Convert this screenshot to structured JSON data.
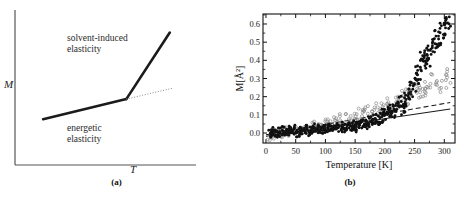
{
  "figure": {
    "panels": [
      {
        "id": "a",
        "caption": "(a)",
        "xlabel": "T",
        "ylabel": "M",
        "annotations": [
          {
            "key": "upper",
            "text": "solvent-induced\nelasticity"
          },
          {
            "key": "lower",
            "text": "energetic\nelasticity"
          }
        ],
        "chart_data": {
          "type": "line",
          "title": "",
          "xlabel": "T",
          "ylabel": "M",
          "xlim": [
            0,
            1
          ],
          "ylim": [
            0,
            1
          ],
          "grid": false,
          "legend": "none",
          "axes_style": "open-L (left and bottom spines only), no tick marks, no numeric ticks",
          "series": [
            {
              "name": "energetic elasticity regime",
              "style": "thick solid",
              "points": [
                [
                  0.155,
                  0.295
                ],
                [
                  0.615,
                  0.425
                ]
              ]
            },
            {
              "name": "solvent-induced elasticity regime",
              "style": "thick solid",
              "points": [
                [
                  0.615,
                  0.425
                ],
                [
                  0.855,
                  0.855
                ]
              ]
            },
            {
              "name": "extrapolation of energetic slope",
              "style": "fine dotted",
              "points": [
                [
                  0.615,
                  0.425
                ],
                [
                  0.875,
                  0.497
                ]
              ]
            }
          ]
        }
      },
      {
        "id": "b",
        "caption": "(b)",
        "chart_data": {
          "type": "scatter",
          "title": "",
          "xlabel": "Temperature [K]",
          "ylabel": "M[Å²]",
          "xlim": [
            -5,
            318
          ],
          "ylim": [
            -0.055,
            0.655
          ],
          "xticks": [
            0,
            50,
            100,
            150,
            200,
            250,
            300
          ],
          "yticks": [
            0.0,
            0.1,
            0.2,
            0.3,
            0.4,
            0.5,
            0.6
          ],
          "ytick_labels": [
            "0.0",
            "0.1",
            "0.2",
            "0.3",
            "0.4",
            "0.5",
            "0.6"
          ],
          "xtick_labels": [
            "0",
            "50",
            "100",
            "150",
            "200",
            "250",
            "300"
          ],
          "grid": false,
          "legend": "none",
          "frame": "full box, ticks inward on all four sides",
          "series": [
            {
              "name": "filled circles",
              "marker": "filled-circle",
              "color": "#111111",
              "description": "noisy near zero below 150 K, rising steeply above 200 K to 0.62",
              "x": [
                8,
                12,
                16,
                20,
                24,
                28,
                32,
                36,
                40,
                44,
                48,
                52,
                56,
                60,
                64,
                68,
                72,
                76,
                80,
                84,
                88,
                92,
                96,
                100,
                104,
                108,
                112,
                116,
                120,
                124,
                128,
                132,
                136,
                140,
                144,
                148,
                152,
                156,
                160,
                164,
                168,
                172,
                176,
                180,
                184,
                188,
                192,
                196,
                200,
                204,
                208,
                212,
                216,
                220,
                224,
                228,
                232,
                236,
                240,
                244,
                248,
                252,
                256,
                260,
                264,
                268,
                272,
                276,
                280,
                284,
                288,
                292,
                296,
                300,
                304,
                308
              ],
              "y": [
                0.005,
                -0.012,
                0.018,
                0.002,
                -0.008,
                0.022,
                0.006,
                -0.004,
                0.015,
                0.027,
                0.004,
                -0.01,
                0.019,
                0.009,
                0.03,
                0.013,
                -0.002,
                0.024,
                0.011,
                0.034,
                0.018,
                0.006,
                0.028,
                0.015,
                0.04,
                0.022,
                0.009,
                0.035,
                0.02,
                0.046,
                0.029,
                0.014,
                0.041,
                0.026,
                0.052,
                0.035,
                0.021,
                0.058,
                0.043,
                0.069,
                0.05,
                0.036,
                0.078,
                0.061,
                0.09,
                0.072,
                0.058,
                0.104,
                0.086,
                0.118,
                0.1,
                0.13,
                0.112,
                0.15,
                0.132,
                0.168,
                0.148,
                0.19,
                0.215,
                0.24,
                0.268,
                0.3,
                0.33,
                0.362,
                0.398,
                0.425,
                0.412,
                0.448,
                0.47,
                0.492,
                0.512,
                0.53,
                0.556,
                0.578,
                0.6,
                0.62
              ]
            },
            {
              "name": "open circles",
              "marker": "open-circle",
              "color": "#8a8a8a",
              "description": "tracks filled series at low T, saturates near 0.28-0.33 above 250 K",
              "x": [
                10,
                18,
                26,
                34,
                42,
                50,
                58,
                66,
                74,
                82,
                90,
                98,
                106,
                114,
                122,
                130,
                138,
                146,
                154,
                162,
                170,
                178,
                186,
                194,
                202,
                210,
                218,
                226,
                234,
                242,
                250,
                258,
                266,
                274,
                282,
                290,
                298,
                306
              ],
              "y": [
                -0.02,
                0.01,
                -0.005,
                0.02,
                0.0,
                0.028,
                0.012,
                0.035,
                0.02,
                0.048,
                0.03,
                0.06,
                0.042,
                0.072,
                0.055,
                0.085,
                0.068,
                0.098,
                0.082,
                0.112,
                0.128,
                0.115,
                0.145,
                0.132,
                0.162,
                0.15,
                0.18,
                0.172,
                0.205,
                0.195,
                0.228,
                0.218,
                0.252,
                0.245,
                0.275,
                0.268,
                0.3,
                0.312
              ]
            }
          ],
          "reference_lines": [
            {
              "name": "dashed reference line",
              "style": "dashed",
              "color": "#1a1a1a",
              "points": [
                [
                  0,
                  -0.01
                ],
                [
                  310,
                  0.168
                ]
              ]
            },
            {
              "name": "solid reference line",
              "style": "solid",
              "color": "#1a1a1a",
              "points": [
                [
                  0,
                  -0.018
                ],
                [
                  310,
                  0.132
                ]
              ]
            }
          ]
        }
      }
    ]
  }
}
